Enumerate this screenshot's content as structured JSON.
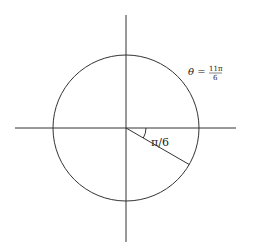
{
  "diagram": {
    "type": "unit-circle-angle",
    "center": [
      126,
      128
    ],
    "radius": 73,
    "axes": {
      "horizontal": {
        "x1": 15,
        "x2": 236,
        "y": 128
      },
      "vertical": {
        "x": 126,
        "y1": 15,
        "y2": 242
      }
    },
    "terminal_ray": {
      "angle_deg": -30,
      "end": [
        189,
        165
      ]
    },
    "angle_arc_radius": 20,
    "labels": {
      "reference_angle": "π/6",
      "theta_lhs": "θ =",
      "theta_num": "11π",
      "theta_den": "6"
    },
    "colors": {
      "stroke": "#333333",
      "background": "#ffffff"
    }
  }
}
